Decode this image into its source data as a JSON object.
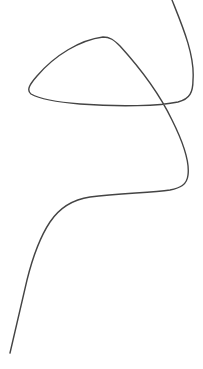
{
  "drawing": {
    "background": "#ffffff",
    "stroke_color": "#444444",
    "stroke_width": 1.4,
    "curves": [
      {
        "name": "freehand-curve",
        "d": "M 172 0 C 182 25, 195 55, 193 80 C 193 92, 190 99, 178 102 C 160 106, 120 107, 80 104 C 55 102, 38 98, 31 94 C 26 90, 30 84, 37 76 C 55 55, 80 40, 103 37 C 110 37, 114 40, 120 46 C 140 68, 160 95, 172 120 C 182 140, 190 160, 188 175 C 187 185, 180 188, 170 190 C 150 193, 120 193, 90 197 C 70 200, 58 210, 50 222 C 38 240, 32 260, 27 280 C 20 310, 14 335, 10 353"
      }
    ]
  }
}
